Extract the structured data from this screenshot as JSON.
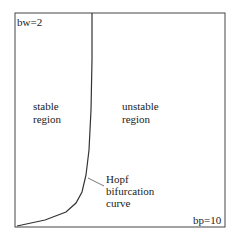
{
  "diagram": {
    "corner_top_left": "bw=2",
    "corner_bottom_right": "bp=10",
    "stable_region": [
      "stable",
      "region"
    ],
    "unstable_region": [
      "unstable",
      "region"
    ],
    "curve_label": [
      "Hopf",
      "bifurcation",
      "curve"
    ]
  }
}
